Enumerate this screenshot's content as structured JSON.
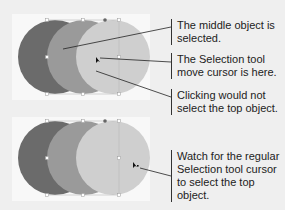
{
  "colors": {
    "background": "#efefef",
    "panel": "#f8f8f8",
    "circle_back": "#6b6b6b",
    "circle_middle": "#9a9a9a",
    "circle_front": "#cfcfcf",
    "leader_line": "#222222"
  },
  "top_panel": {
    "callouts": [
      {
        "text": "The middle object is selected."
      },
      {
        "text": "The Selection tool move cursor is here."
      },
      {
        "text": "Clicking would not select the top object."
      }
    ],
    "cursor_icon": "selection-move-cursor"
  },
  "bottom_panel": {
    "callouts": [
      {
        "text": "Watch for the regular Selection tool cursor to select the top object."
      }
    ],
    "cursor_icon": "selection-cursor"
  }
}
